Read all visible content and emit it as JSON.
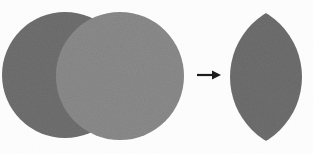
{
  "figure": {
    "background_color": "#fdfdfd",
    "width": 313,
    "height": 154
  },
  "colors": {
    "circle_left_fill": "#6f6f6f",
    "circle_right_fill": "#8b8b8b",
    "intersection_fill": "#6f6f6f",
    "result_lens_fill": "#6e6e6e",
    "arrow_color": "#1a1a1a",
    "background": "#fdfdfd"
  },
  "shapes": {
    "circle_left": {
      "label": "left circle",
      "cx": 65,
      "cy": 75,
      "r": 63,
      "fill": "#6f6f6f"
    },
    "circle_right": {
      "label": "right circle",
      "cx": 120,
      "cy": 76,
      "r": 64,
      "fill": "#8b8b8b"
    },
    "result_lens": {
      "label": "lens shaped intersection result",
      "cx": 266,
      "cy": 77,
      "half_width": 36,
      "half_height": 64,
      "top_y": 14,
      "bottom_y": 141,
      "left_x": 230,
      "right_x": 302,
      "fill": "#6e6e6e"
    }
  },
  "arrow": {
    "label": "yields",
    "glyph": "arrow-right",
    "x_start": 197,
    "x_end": 221,
    "y": 75,
    "color": "#1a1a1a",
    "stroke_width": 2.2,
    "head_width": 9,
    "head_height": 9
  },
  "accessibility": {
    "description": "Two overlapping gray circles on the left; an arrow pointing right; a lens shaped region on the right representing their intersection."
  }
}
